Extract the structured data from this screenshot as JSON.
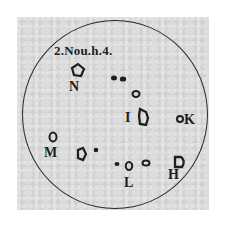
{
  "drawing": {
    "title": "2.Nou.h.4.",
    "labels": {
      "N": "N",
      "I": "I",
      "K": "K",
      "M": "M",
      "L": "L",
      "H": "H"
    },
    "colors": {
      "paper": "#dcdcdc",
      "ink": "#1e1e1e"
    }
  }
}
